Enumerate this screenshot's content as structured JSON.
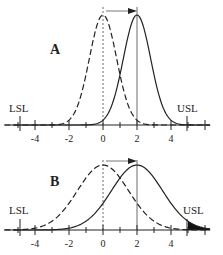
{
  "chart_data": [
    {
      "panel": "A",
      "type": "line",
      "title": "A",
      "xlabel": "",
      "ylabel": "",
      "xticks": [
        -4,
        -2,
        0,
        2,
        4
      ],
      "xlim": [
        -5.8,
        6.3
      ],
      "spec_limits": {
        "LSL": -5,
        "USL": 5
      },
      "series": [
        {
          "name": "original process",
          "style": "dashed",
          "mean": 0,
          "sigma": 0.8
        },
        {
          "name": "shifted process",
          "style": "solid",
          "mean": 2,
          "sigma": 0.8
        }
      ],
      "annotation": "arrow showing mean shift from 0 to 2",
      "shaded_tail": false
    },
    {
      "panel": "B",
      "type": "line",
      "title": "B",
      "xlabel": "",
      "ylabel": "",
      "xticks": [
        -4,
        -2,
        0,
        2,
        4
      ],
      "xlim": [
        -5.8,
        6.3
      ],
      "spec_limits": {
        "LSL": -5,
        "USL": 5
      },
      "series": [
        {
          "name": "original process",
          "style": "dashed",
          "mean": 0,
          "sigma": 1.5
        },
        {
          "name": "shifted process",
          "style": "solid",
          "mean": 2,
          "sigma": 1.5
        }
      ],
      "annotation": "arrow showing mean shift from 0 to 2",
      "shaded_tail": true
    }
  ],
  "labels": {
    "panelA": "A",
    "panelB": "B",
    "lsl": "LSL",
    "usl": "USL",
    "ticks": [
      "-4",
      "-2",
      "0",
      "2",
      "4"
    ]
  }
}
